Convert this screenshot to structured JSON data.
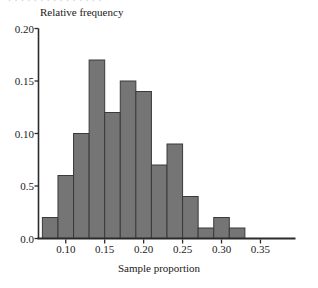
{
  "figure": {
    "top_remnant_text": "· · · · · · · · · · · · · · ·"
  },
  "chart_data": {
    "type": "bar",
    "title": "",
    "subtitle": "",
    "xlabel": "Sample proportion",
    "ylabel": "Relative frequency",
    "bin_width": 0.02,
    "bin_start": 0.07,
    "categories": [
      "0.07-0.09",
      "0.09-0.11",
      "0.11-0.13",
      "0.13-0.15",
      "0.15-0.17",
      "0.17-0.19",
      "0.19-0.21",
      "0.21-0.23",
      "0.23-0.25",
      "0.25-0.27",
      "0.27-0.29",
      "0.29-0.31",
      "0.31-0.33",
      "0.33-0.35",
      "0.35-0.37",
      "0.37-0.39"
    ],
    "bin_edges": [
      0.07,
      0.09,
      0.11,
      0.13,
      0.15,
      0.17,
      0.19,
      0.21,
      0.23,
      0.25,
      0.27,
      0.29,
      0.31,
      0.33,
      0.35,
      0.37,
      0.39
    ],
    "values": [
      0.02,
      0.06,
      0.1,
      0.17,
      0.12,
      0.15,
      0.14,
      0.07,
      0.09,
      0.04,
      0.01,
      0.02,
      0.01,
      0.0,
      0.0,
      0.0
    ],
    "bars": [
      {
        "left": 0.07,
        "right": 0.09,
        "value": 0.02
      },
      {
        "left": 0.09,
        "right": 0.11,
        "value": 0.06
      },
      {
        "left": 0.11,
        "right": 0.13,
        "value": 0.1
      },
      {
        "left": 0.13,
        "right": 0.15,
        "value": 0.17
      },
      {
        "left": 0.15,
        "right": 0.17,
        "value": 0.12
      },
      {
        "left": 0.17,
        "right": 0.19,
        "value": 0.15
      },
      {
        "left": 0.19,
        "right": 0.21,
        "value": 0.14
      },
      {
        "left": 0.21,
        "right": 0.23,
        "value": 0.07
      },
      {
        "left": 0.23,
        "right": 0.25,
        "value": 0.09
      },
      {
        "left": 0.25,
        "right": 0.27,
        "value": 0.04
      },
      {
        "left": 0.27,
        "right": 0.29,
        "value": 0.01
      },
      {
        "left": 0.29,
        "right": 0.31,
        "value": 0.02
      },
      {
        "left": 0.31,
        "right": 0.33,
        "value": 0.01
      }
    ],
    "xlim": [
      0.065,
      0.395
    ],
    "ylim": [
      0.0,
      0.2
    ],
    "grid": false,
    "legend": null,
    "yticks": [
      {
        "value": 0.0,
        "label": "0.0"
      },
      {
        "value": 0.05,
        "label": "0.5"
      },
      {
        "value": 0.1,
        "label": "0.10"
      },
      {
        "value": 0.15,
        "label": "0.15"
      },
      {
        "value": 0.2,
        "label": "0.20"
      }
    ],
    "xticks": [
      {
        "value": 0.1,
        "label": "0.10"
      },
      {
        "value": 0.15,
        "label": "0.15"
      },
      {
        "value": 0.2,
        "label": "0.20"
      },
      {
        "value": 0.25,
        "label": "0.25"
      },
      {
        "value": 0.3,
        "label": "0.30"
      },
      {
        "value": 0.35,
        "label": "0.35"
      }
    ],
    "colors": {
      "bar_fill": "#757575",
      "bar_stroke": "#3a3a3a",
      "axis": "#2b2b2b",
      "text": "#1a1a1a",
      "background": "#ffffff"
    }
  }
}
